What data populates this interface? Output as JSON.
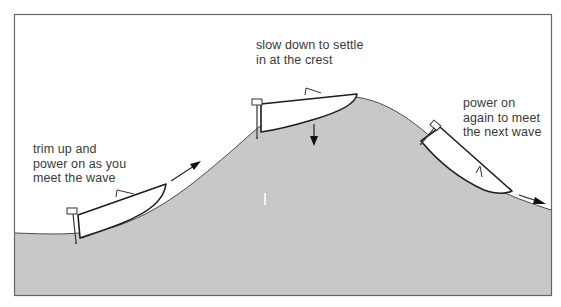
{
  "figure": {
    "type": "diagram",
    "colors": {
      "water": "#c8c8c8",
      "sky": "#ffffff",
      "line": "#2a2a2a",
      "frame": "#555555",
      "text": "#3a3a3a"
    }
  },
  "labels": {
    "left": {
      "lines": [
        "trim up and",
        "power on as you",
        "meet the wave"
      ]
    },
    "center": {
      "lines": [
        "slow down to settle",
        "in at the crest"
      ]
    },
    "right": {
      "lines": [
        "power on",
        "again to meet",
        "the next wave"
      ]
    }
  },
  "stages": [
    {
      "position": "trough / wave face",
      "action": "trim up and power on as you meet the wave",
      "arrow": "forward-up"
    },
    {
      "position": "crest",
      "action": "slow down to settle in at the crest",
      "arrow": "down"
    },
    {
      "position": "back of wave",
      "action": "power on again to meet the next wave",
      "arrow": "forward-down"
    }
  ]
}
